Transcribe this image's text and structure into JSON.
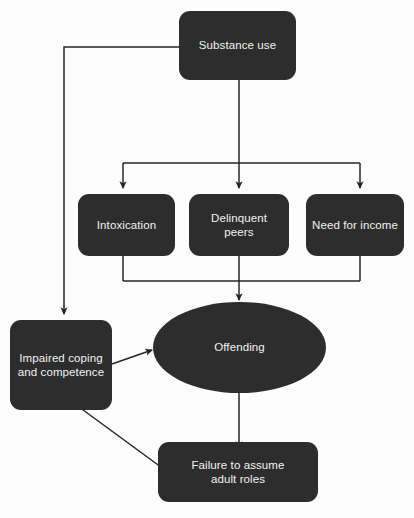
{
  "diagram": {
    "theme": {
      "node_fill": "#2d2d2d",
      "node_text": "#f2f2f2",
      "connector": "#262626",
      "background": "#fdfdfd"
    },
    "nodes": [
      {
        "id": "substance-use",
        "label": "Substance use",
        "shape": "rounded-rect",
        "x": 179,
        "y": 11,
        "w": 117,
        "h": 69
      },
      {
        "id": "intoxication",
        "label": "Intoxication",
        "shape": "rounded-rect",
        "x": 78,
        "y": 194,
        "w": 97,
        "h": 62
      },
      {
        "id": "delinquent-peers",
        "label": "Delinquent peers",
        "shape": "rounded-rect",
        "x": 189,
        "y": 194,
        "w": 100,
        "h": 62
      },
      {
        "id": "need-for-income",
        "label": "Need for income",
        "shape": "rounded-rect",
        "x": 306,
        "y": 194,
        "w": 98,
        "h": 62
      },
      {
        "id": "impaired-coping",
        "label": "Impaired coping\nand competence",
        "shape": "rounded-rect",
        "x": 10,
        "y": 320,
        "w": 102,
        "h": 90
      },
      {
        "id": "offending",
        "label": "Offending",
        "shape": "ellipse",
        "x": 153,
        "y": 302,
        "w": 173,
        "h": 91
      },
      {
        "id": "failure-adult-roles",
        "label": "Failure to assume\nadult roles",
        "shape": "rounded-rect",
        "x": 158,
        "y": 442,
        "w": 160,
        "h": 60
      }
    ],
    "edges": [
      {
        "id": "edge-substance-to-impaired",
        "from": "substance-use",
        "to": "impaired-coping",
        "style": "orthogonal",
        "arrow": true
      },
      {
        "id": "edge-substance-to-intoxication",
        "from": "substance-use",
        "to": "intoxication",
        "style": "orthogonal",
        "arrow": true
      },
      {
        "id": "edge-substance-to-peers",
        "from": "substance-use",
        "to": "delinquent-peers",
        "style": "orthogonal",
        "arrow": true
      },
      {
        "id": "edge-substance-to-income",
        "from": "substance-use",
        "to": "need-for-income",
        "style": "orthogonal",
        "arrow": true
      },
      {
        "id": "edge-intoxication-to-offending",
        "from": "intoxication",
        "to": "offending",
        "style": "orthogonal",
        "arrow": true
      },
      {
        "id": "edge-peers-to-offending",
        "from": "delinquent-peers",
        "to": "offending",
        "style": "orthogonal",
        "arrow": true
      },
      {
        "id": "edge-income-to-offending",
        "from": "need-for-income",
        "to": "offending",
        "style": "orthogonal",
        "arrow": true
      },
      {
        "id": "edge-impaired-to-offending",
        "from": "impaired-coping",
        "to": "offending",
        "style": "diagonal",
        "arrow": true
      },
      {
        "id": "edge-impaired-to-failure",
        "from": "impaired-coping",
        "to": "failure-adult-roles",
        "style": "diagonal",
        "arrow": true
      },
      {
        "id": "edge-offending-to-failure",
        "from": "offending",
        "to": "failure-adult-roles",
        "style": "straight",
        "arrow": true
      }
    ]
  }
}
